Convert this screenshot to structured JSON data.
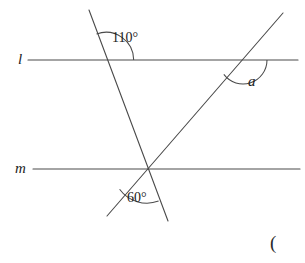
{
  "figure": {
    "background_color": "#ffffff",
    "stroke_color": "#4a4a4a",
    "text_color": "#1c1c1c",
    "width": 305,
    "height": 263
  },
  "labels": {
    "line_l": "l",
    "line_m": "m",
    "angle_110": "110°",
    "angle_60": "60°",
    "angle_a": "a",
    "stray_paren": "("
  },
  "chart_data": {
    "type": "diagram",
    "elements": [
      {
        "kind": "line",
        "name": "line-l",
        "label": "l",
        "role": "parallel-line-upper",
        "x1": 28,
        "y1": 60,
        "x2": 298,
        "y2": 60
      },
      {
        "kind": "line",
        "name": "line-m",
        "label": "m",
        "role": "parallel-line-lower",
        "x1": 33,
        "y1": 169,
        "x2": 300,
        "y2": 169
      },
      {
        "kind": "line",
        "name": "transversal-steep",
        "label": "",
        "role": "transversal-descending",
        "x1": 89,
        "y1": 10,
        "x2": 168,
        "y2": 221
      },
      {
        "kind": "line",
        "name": "transversal-rising",
        "label": "",
        "role": "transversal-ascending",
        "x1": 107,
        "y1": 216,
        "x2": 283,
        "y2": 13
      }
    ],
    "intersections": [
      {
        "name": "steep-meets-l",
        "x": 106,
        "y": 60
      },
      {
        "name": "rising-meets-l",
        "x": 243,
        "y": 60
      },
      {
        "name": "triple-point-on-m",
        "x": 147,
        "y": 169
      }
    ],
    "angles": [
      {
        "name": "angle-110",
        "label": "110°",
        "value": 110,
        "unit": "degrees",
        "vertex_x": 106,
        "vertex_y": 60,
        "label_x": 113,
        "label_y": 31,
        "arc_radius": 26,
        "known": true
      },
      {
        "name": "angle-60",
        "label": "60°",
        "value": 60,
        "unit": "degrees",
        "vertex_x": 147,
        "vertex_y": 169,
        "label_x": 128,
        "label_y": 191,
        "arc_radius": 30,
        "known": true
      },
      {
        "name": "angle-a",
        "label": "a",
        "value": null,
        "unit": "degrees",
        "vertex_x": 243,
        "vertex_y": 60,
        "label_x": 248,
        "label_y": 74,
        "arc_radius": 22,
        "known": false
      }
    ],
    "annotations": [
      {
        "name": "stray-paren",
        "text": "(",
        "x": 270,
        "y": 233
      }
    ]
  }
}
